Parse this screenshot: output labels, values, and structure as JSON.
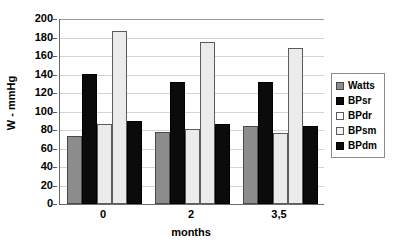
{
  "chart_data": {
    "type": "bar",
    "title": "",
    "subtitle": "",
    "xlabel": "months",
    "ylabel": "W - mmHg",
    "categories": [
      "0",
      "2",
      "3,5"
    ],
    "series": [
      {
        "name": "Watts",
        "color": "#8d8d8d",
        "values": [
          73,
          78,
          84
        ]
      },
      {
        "name": "BPsr",
        "color": "#0b0b0b",
        "values": [
          141,
          132,
          132
        ]
      },
      {
        "name": "BPdr",
        "color": "#ebebeb",
        "values": [
          87,
          81,
          77
        ]
      },
      {
        "name": "BPsm",
        "color": "#ebebeb",
        "values": [
          187,
          175,
          169
        ]
      },
      {
        "name": "BPdm",
        "color": "#0b0b0b",
        "values": [
          90,
          86,
          84
        ]
      }
    ],
    "ylim": [
      0,
      200
    ],
    "ytick_step": 20,
    "yticks": [
      200,
      180,
      160,
      140,
      120,
      100,
      80,
      60,
      40,
      20,
      0
    ],
    "grid": true,
    "grid_axis": "y",
    "legend_position": "right",
    "legend_entries": [
      "Watts",
      "BPsr",
      "BPdr",
      "BPsm",
      "BPdm"
    ]
  }
}
